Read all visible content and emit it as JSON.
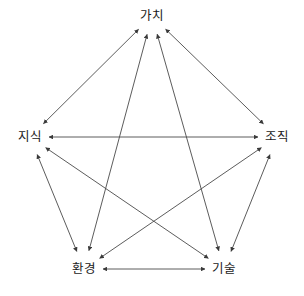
{
  "diagram": {
    "type": "pentagram-relationship-diagram",
    "background_color": "#ffffff",
    "line_color": "#4a4a4a",
    "text_color": "#1a1a1a",
    "nodes": [
      {
        "id": "value",
        "label": "가치",
        "x": 152,
        "y": 16
      },
      {
        "id": "knowledge",
        "label": "지식",
        "x": 30,
        "y": 137
      },
      {
        "id": "organization",
        "label": "조직",
        "x": 277,
        "y": 137
      },
      {
        "id": "environment",
        "label": "환경",
        "x": 84,
        "y": 269
      },
      {
        "id": "technology",
        "label": "기술",
        "x": 224,
        "y": 269
      }
    ],
    "edges": [
      {
        "from": "knowledge",
        "to": "value",
        "arrows": "both",
        "kind": "outer"
      },
      {
        "from": "value",
        "to": "organization",
        "arrows": "both",
        "kind": "outer"
      },
      {
        "from": "organization",
        "to": "technology",
        "arrows": "both",
        "kind": "outer"
      },
      {
        "from": "technology",
        "to": "environment",
        "arrows": "both",
        "kind": "outer"
      },
      {
        "from": "environment",
        "to": "knowledge",
        "arrows": "both",
        "kind": "outer"
      },
      {
        "from": "knowledge",
        "to": "organization",
        "arrows": "both",
        "kind": "inner"
      },
      {
        "from": "value",
        "to": "environment",
        "arrows": "both",
        "kind": "inner"
      },
      {
        "from": "value",
        "to": "technology",
        "arrows": "both",
        "kind": "inner"
      },
      {
        "from": "knowledge",
        "to": "technology",
        "arrows": "both",
        "kind": "inner"
      },
      {
        "from": "organization",
        "to": "environment",
        "arrows": "both",
        "kind": "inner"
      }
    ]
  }
}
